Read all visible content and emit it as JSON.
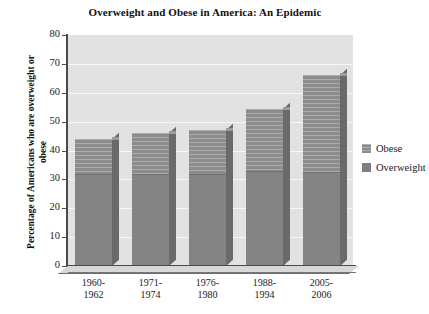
{
  "chart_data": {
    "type": "bar",
    "subtype": "stacked-bar-3d",
    "title": "Overweight and Obese in America: An Epidemic",
    "xlabel": "",
    "ylabel": "Percentage of Americans who are overweight or obese",
    "ylim": [
      0,
      80
    ],
    "ytick_step": 10,
    "yticks": [
      "80",
      "70",
      "60",
      "50",
      "40",
      "30",
      "20",
      "10",
      "0"
    ],
    "ytick_values": [
      80,
      70,
      60,
      50,
      40,
      30,
      20,
      10,
      0
    ],
    "grid": true,
    "grid_color": "#f7f7f7",
    "plot_background": "#e2e2e2",
    "legend_position": "right",
    "categories": [
      "1960-1962",
      "1971-1974",
      "1976-1980",
      "1988-1994",
      "2005-2006"
    ],
    "category_lines": [
      [
        "1960-",
        "1962"
      ],
      [
        "1971-",
        "1974"
      ],
      [
        "1976-",
        "1980"
      ],
      [
        "1988-",
        "1994"
      ],
      [
        "2005-",
        "2006"
      ]
    ],
    "series": [
      {
        "name": "Overweight",
        "color": "#7f7f7f",
        "values": [
          32,
          32,
          32,
          33,
          32.5
        ]
      },
      {
        "name": "Obese",
        "color": "#8c8c8c",
        "values": [
          12,
          14,
          15,
          21.5,
          33.5
        ]
      }
    ],
    "totals": [
      44,
      46,
      47,
      54.5,
      66
    ],
    "legend": [
      {
        "label": "Obese",
        "swatch": "obese"
      },
      {
        "label": "Overweight",
        "swatch": "overweight"
      }
    ]
  },
  "colors": {
    "axis": "#4a4a4a",
    "text": "#1a1a1a",
    "plot_bg": "#e2e2e2",
    "gridline": "#f7f7f7",
    "bar_lower": "#848484",
    "bar_upper": "#8c8c8c",
    "bar_side": "#6a6a6a",
    "page_bg": "#ffffff"
  }
}
